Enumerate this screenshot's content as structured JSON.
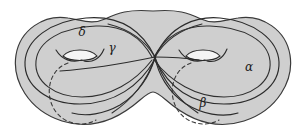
{
  "figure": {
    "name": "genus-two-surface-with-curves",
    "colors": {
      "surface_fill": "#cfcfcf",
      "outline_stroke": "#3a3a3a",
      "curve_stroke": "#2b2b2b",
      "hidden_curve_stroke": "#3a3a3a",
      "hole_fill": "#f2f2f2",
      "background": "#ffffff",
      "label_color": "#1b1b1b"
    },
    "labels": [
      {
        "id": "delta",
        "text": "δ",
        "x": 82,
        "y": 36
      },
      {
        "id": "gamma",
        "text": "γ",
        "x": 112,
        "y": 52
      },
      {
        "id": "alpha",
        "text": "α",
        "x": 249,
        "y": 71
      },
      {
        "id": "beta",
        "text": "β",
        "x": 203,
        "y": 107
      }
    ],
    "curves": [
      {
        "id": "alpha",
        "style": "solid-and-dashed",
        "role": "longitude of right handle"
      },
      {
        "id": "beta",
        "style": "solid-and-dashed",
        "role": "curve through right hole crossing the center"
      },
      {
        "id": "gamma",
        "style": "solid",
        "role": "separating curve near left handle"
      },
      {
        "id": "delta",
        "style": "solid",
        "role": "longitude of left handle"
      }
    ],
    "handles": [
      {
        "id": "left-handle-hole",
        "cx": 80,
        "cy": 55,
        "rx": 17,
        "ry": 6
      },
      {
        "id": "right-handle-hole",
        "cx": 203,
        "cy": 55,
        "rx": 17,
        "ry": 6
      }
    ],
    "crossing_point": {
      "x": 155,
      "y": 57
    }
  }
}
